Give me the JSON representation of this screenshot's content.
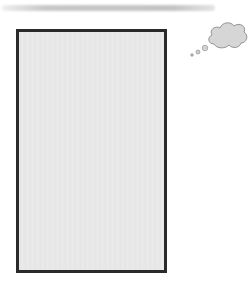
{
  "image": {
    "description": "Blank gray rectangle panel with a thought-bubble cloud icon and a faint gray stripe above",
    "icons": [
      "thought-bubble-icon"
    ],
    "colors": {
      "panel_fill": "#e8e8e8",
      "panel_border": "#2a2a2a",
      "stripe": "#c8c8c8",
      "cloud_fill": "#d6d6d6",
      "cloud_stroke": "#8a8a8a"
    }
  }
}
